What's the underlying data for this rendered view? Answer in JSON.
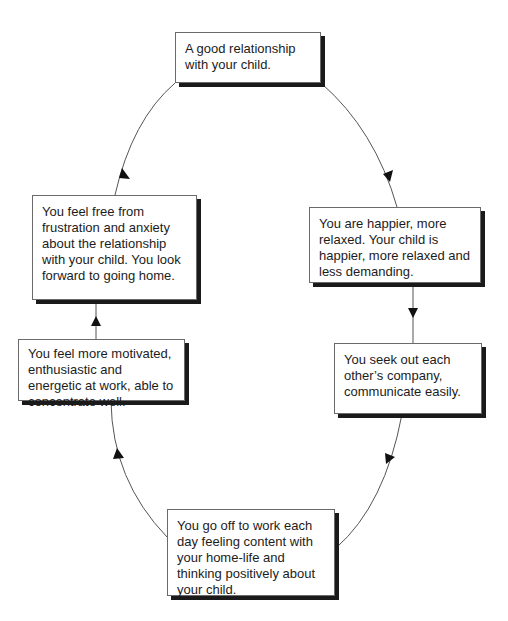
{
  "diagram": {
    "type": "cycle",
    "header_fragment": "",
    "nodes": [
      {
        "id": "top",
        "text": "A good relationship with your child."
      },
      {
        "id": "upper-right",
        "text": "You are happier, more relaxed. Your child is happier, more relaxed and less demanding."
      },
      {
        "id": "lower-right",
        "text": "You seek out each other’s company, communicate easily."
      },
      {
        "id": "bottom",
        "text": "You go off to work each day feeling content with your home-life and thinking positively about your child."
      },
      {
        "id": "lower-left",
        "text": "You feel more motivated, enthusiastic and energetic at work, able to concentrate well."
      },
      {
        "id": "upper-left",
        "text": "You feel free from frustration and anxiety about the relationship with your child. You look forward to going home."
      }
    ],
    "edges": [
      {
        "from": "top",
        "to": "upper-right"
      },
      {
        "from": "upper-right",
        "to": "lower-right"
      },
      {
        "from": "lower-right",
        "to": "bottom"
      },
      {
        "from": "bottom",
        "to": "lower-left"
      },
      {
        "from": "lower-left",
        "to": "upper-left"
      },
      {
        "from": "upper-left",
        "to": "top"
      }
    ],
    "colors": {
      "line": "#555555",
      "shadow": "#1a1a1a",
      "border": "#6a6a6a",
      "text": "#1c1c1c"
    }
  }
}
